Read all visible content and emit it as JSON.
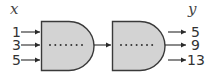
{
  "input_label": "x",
  "output_label": "y",
  "inputs": [
    "1",
    "3",
    "5"
  ],
  "outputs": [
    "5",
    "9",
    "13"
  ],
  "gates": [
    {
      "name": "first-stage",
      "inner_dots": 7
    },
    {
      "name": "second-stage",
      "inner_dots": 7
    }
  ],
  "colors": {
    "gate_fill": "#d3d3d3",
    "gate_stroke": "#3a3a3a",
    "text": "#333333"
  }
}
